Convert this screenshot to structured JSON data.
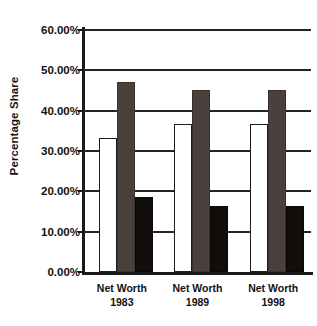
{
  "chart_data": {
    "type": "bar",
    "title": "",
    "xlabel": "",
    "ylabel": "Percentage Share",
    "categories": [
      "Net Worth 1983",
      "Net Worth 1989",
      "Net Worth 1998"
    ],
    "category_lines": [
      {
        "line1": "Net Worth",
        "line2": "1983"
      },
      {
        "line1": "Net Worth",
        "line2": "1989"
      },
      {
        "line1": "Net Worth",
        "line2": "1998"
      }
    ],
    "series": [
      {
        "name": "series-1",
        "color": "#ffffff",
        "values": [
          33.3,
          36.7,
          36.7
        ]
      },
      {
        "name": "series-2",
        "color": "#4a403c",
        "values": [
          47.1,
          45.2,
          45.2
        ]
      },
      {
        "name": "series-3",
        "color": "#120c0a",
        "values": [
          18.6,
          16.4,
          16.4
        ]
      }
    ],
    "ylim": [
      0,
      60
    ],
    "ytick_values": [
      0,
      10,
      20,
      30,
      40,
      50,
      60
    ],
    "ytick_labels": [
      "0.00%",
      "10.00%",
      "20.00%",
      "30.00%",
      "40.00%",
      "50.00%",
      "60.00%"
    ],
    "grid": true,
    "grid_axis": "y",
    "legend": false,
    "legend_position": "none",
    "value_format": "percent"
  }
}
